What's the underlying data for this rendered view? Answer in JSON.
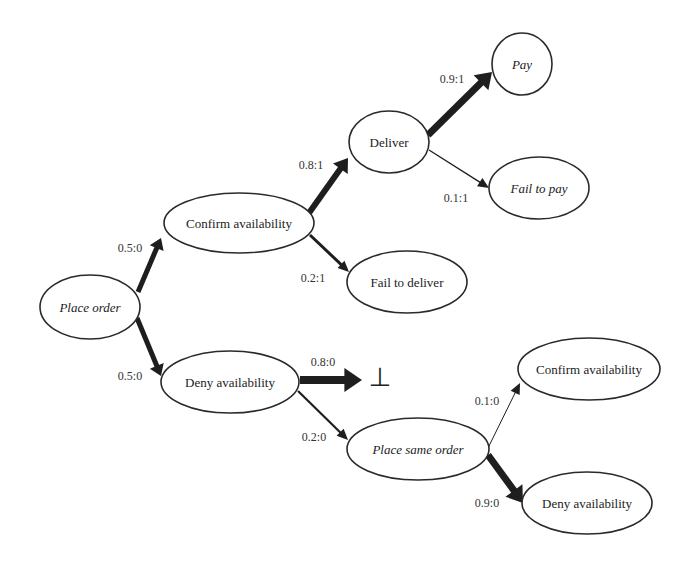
{
  "diagram": {
    "type": "probabilistic state transition tree",
    "nodes": [
      {
        "id": "place_order",
        "label": "Place order",
        "italic": true,
        "cx": 90,
        "cy": 307,
        "rx": 50,
        "ry": 32
      },
      {
        "id": "confirm_availability_1",
        "label": "Confirm availability",
        "italic": false,
        "cx": 239,
        "cy": 223,
        "rx": 75,
        "ry": 30
      },
      {
        "id": "deny_availability_1",
        "label": "Deny availability",
        "italic": false,
        "cx": 230,
        "cy": 382,
        "rx": 69,
        "ry": 31
      },
      {
        "id": "deliver",
        "label": "Deliver",
        "italic": false,
        "cx": 389,
        "cy": 142,
        "rx": 40,
        "ry": 31
      },
      {
        "id": "fail_to_deliver",
        "label": "Fail to deliver",
        "italic": false,
        "cx": 407,
        "cy": 282,
        "rx": 60,
        "ry": 31
      },
      {
        "id": "pay",
        "label": "Pay",
        "italic": true,
        "cx": 522,
        "cy": 64,
        "rx": 30,
        "ry": 31
      },
      {
        "id": "fail_to_pay",
        "label": "Fail to pay",
        "italic": true,
        "cx": 539,
        "cy": 188,
        "rx": 50,
        "ry": 31
      },
      {
        "id": "place_same_order",
        "label": "Place same order",
        "italic": true,
        "cx": 418,
        "cy": 449,
        "rx": 71,
        "ry": 31
      },
      {
        "id": "confirm_availability_2",
        "label": "Confirm availability",
        "italic": false,
        "cx": 589,
        "cy": 369,
        "rx": 71,
        "ry": 31
      },
      {
        "id": "deny_availability_2",
        "label": "Deny availability",
        "italic": false,
        "cx": 587,
        "cy": 503,
        "rx": 65,
        "ry": 31
      }
    ],
    "edges": [
      {
        "from": "place_order",
        "to": "confirm_availability_1",
        "label": "0.5:0",
        "x1": 138,
        "y1": 292,
        "x2": 161,
        "y2": 238,
        "width": 5,
        "lx": 130,
        "ly": 248
      },
      {
        "from": "place_order",
        "to": "deny_availability_1",
        "label": "0.5:0",
        "x1": 137,
        "y1": 318,
        "x2": 161,
        "y2": 376,
        "width": 5,
        "lx": 130,
        "ly": 376
      },
      {
        "from": "confirm_availability_1",
        "to": "deliver",
        "label": "0.8:1",
        "x1": 309,
        "y1": 213,
        "x2": 348,
        "y2": 158,
        "width": 6,
        "lx": 311,
        "ly": 165
      },
      {
        "from": "confirm_availability_1",
        "to": "fail_to_deliver",
        "label": "0.2:1",
        "x1": 310,
        "y1": 235,
        "x2": 349,
        "y2": 272,
        "width": 3,
        "lx": 313,
        "ly": 278
      },
      {
        "from": "deliver",
        "to": "pay",
        "label": "0.9:1",
        "x1": 428,
        "y1": 135,
        "x2": 492,
        "y2": 72,
        "width": 7,
        "lx": 452,
        "ly": 79
      },
      {
        "from": "deliver",
        "to": "fail_to_pay",
        "label": "0.1:1",
        "x1": 429,
        "y1": 150,
        "x2": 489,
        "y2": 188,
        "width": 1.3,
        "lx": 456,
        "ly": 198
      },
      {
        "from": "deny_availability_1",
        "to": "bottom",
        "label": "0.8:0",
        "x1": 300,
        "y1": 380,
        "x2": 362,
        "y2": 380,
        "width": 8,
        "lx": 323,
        "ly": 362
      },
      {
        "from": "deny_availability_1",
        "to": "place_same_order",
        "label": "0.2:0",
        "x1": 298,
        "y1": 391,
        "x2": 348,
        "y2": 440,
        "width": 2.2,
        "lx": 314,
        "ly": 437
      },
      {
        "from": "place_same_order",
        "to": "confirm_availability_2",
        "label": "0.1:0",
        "x1": 488,
        "y1": 448,
        "x2": 520,
        "y2": 383,
        "width": 1,
        "lx": 487,
        "ly": 401
      },
      {
        "from": "place_same_order",
        "to": "deny_availability_2",
        "label": "0.9:0",
        "x1": 488,
        "y1": 455,
        "x2": 523,
        "y2": 503,
        "width": 7,
        "lx": 487,
        "ly": 503
      }
    ],
    "bottom_symbol": {
      "glyph": "⊥",
      "x": 380,
      "y": 377
    }
  }
}
